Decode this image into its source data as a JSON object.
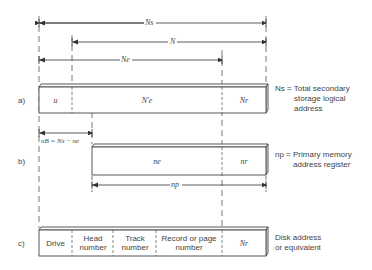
{
  "dimensions": {
    "Ns_label": "Ns",
    "N_label": "N",
    "Ne_label": "Ne",
    "nb_label": "nB = Ns − ne",
    "np_label": "np"
  },
  "row_a": {
    "marker": "a)",
    "fields": [
      "u",
      "N′e",
      "Nr"
    ],
    "description": [
      "Ns = Total secondary",
      "storage logical",
      "address"
    ]
  },
  "row_b": {
    "marker": "b)",
    "fields": [
      "ne",
      "nr"
    ],
    "description": [
      "np = Primary memory",
      "address register"
    ]
  },
  "row_c": {
    "marker": "c)",
    "fields": [
      "Drive",
      "Head number",
      "Track number",
      "Record or page number",
      "Nr"
    ],
    "description": [
      "Disk address",
      "or equivalent"
    ]
  }
}
